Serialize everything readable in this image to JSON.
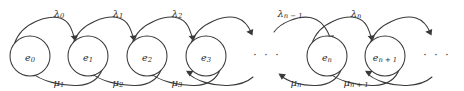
{
  "figure": {
    "kind": "birth-death-process-state-transition-diagram",
    "width": 464,
    "height": 91,
    "background_color": "#ffffff",
    "stroke_color": "#3a3a3a",
    "text_color": "#2b2b2b"
  },
  "states": [
    {
      "id": "e0",
      "base": "e",
      "sub": "0",
      "cx": 30,
      "cy": 56,
      "r": 20
    },
    {
      "id": "e1",
      "base": "e",
      "sub": "1",
      "cx": 88,
      "cy": 56,
      "r": 20
    },
    {
      "id": "e2",
      "base": "e",
      "sub": "2",
      "cx": 147,
      "cy": 56,
      "r": 20
    },
    {
      "id": "e3",
      "base": "e",
      "sub": "3",
      "cx": 206,
      "cy": 56,
      "r": 20
    },
    {
      "id": "en",
      "base": "e",
      "sub": "n",
      "cx": 327,
      "cy": 56,
      "r": 20
    },
    {
      "id": "en1",
      "base": "e",
      "sub": "n + 1",
      "cx": 385,
      "cy": 56,
      "r": 20
    }
  ],
  "birth_rates": [
    {
      "id": "lambda0",
      "base": "λ",
      "sub": "0",
      "x": 59,
      "y": 13
    },
    {
      "id": "lambda1",
      "base": "λ",
      "sub": "1",
      "x": 118,
      "y": 13
    },
    {
      "id": "lambda2",
      "base": "λ",
      "sub": "2",
      "x": 177,
      "y": 13
    },
    {
      "id": "lambdan1",
      "base": "λ",
      "sub": "n − 1",
      "x": 290,
      "y": 13
    },
    {
      "id": "lambdan",
      "base": "λ",
      "sub": "n",
      "x": 356,
      "y": 13
    }
  ],
  "death_rates": [
    {
      "id": "mu1",
      "base": "μ",
      "sub": "1",
      "x": 59,
      "y": 82
    },
    {
      "id": "mu2",
      "base": "μ",
      "sub": "2",
      "x": 118,
      "y": 82
    },
    {
      "id": "mu3",
      "base": "μ",
      "sub": "3",
      "x": 177,
      "y": 82
    },
    {
      "id": "mun",
      "base": "μ",
      "sub": "n",
      "x": 296,
      "y": 82
    },
    {
      "id": "mun1",
      "base": "μ",
      "sub": "n + 1",
      "x": 356,
      "y": 82
    }
  ],
  "ellipses": [
    {
      "id": "ellipsis-middle",
      "text": "· · ·",
      "x": 267,
      "y": 56
    },
    {
      "id": "ellipsis-right",
      "text": "· · ·",
      "x": 437,
      "y": 56
    }
  ],
  "accessibility": {
    "description": "State transition diagram of a birth-death Markov chain with states e0, e1, e2, e3, ellipsis, en, en+1, ellipsis; upward arcs labelled lambda rates move right, downward arcs labelled mu rates move left."
  }
}
